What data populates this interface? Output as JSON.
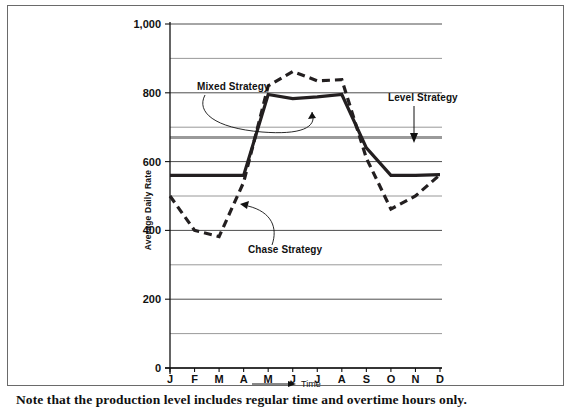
{
  "figure": {
    "caption": "Note that the production level includes regular time and overtime hours only."
  },
  "chart_data": {
    "type": "line",
    "title": "",
    "xlabel": "Time",
    "ylabel": "Average Daily Rate",
    "categories": [
      "J",
      "F",
      "M",
      "A",
      "M",
      "J",
      "J",
      "A",
      "S",
      "O",
      "N",
      "D"
    ],
    "x_tick_labels": [
      "J",
      "F",
      "M",
      "A",
      "M",
      "J",
      "J",
      "A",
      "S",
      "O",
      "N",
      "D"
    ],
    "y_tick_labels": [
      "0",
      "200",
      "400",
      "600",
      "800",
      "1,000"
    ],
    "y_tick_values": [
      0,
      200,
      400,
      600,
      800,
      1000
    ],
    "ylim": [
      0,
      1000
    ],
    "gridlines": [
      0,
      100,
      200,
      300,
      400,
      500,
      600,
      700,
      800,
      900,
      1000
    ],
    "grid": true,
    "legend": "none",
    "series": [
      {
        "name": "Mixed Strategy",
        "style": "solid",
        "color": "#231f20",
        "values": [
          560,
          560,
          560,
          560,
          795,
          783,
          788,
          795,
          640,
          560,
          560,
          562
        ]
      },
      {
        "name": "Chase Strategy",
        "style": "dashed",
        "color": "#231f20",
        "values": [
          500,
          400,
          382,
          540,
          820,
          862,
          835,
          838,
          610,
          462,
          500,
          562
        ]
      },
      {
        "name": "Level Strategy",
        "style": "solid-gray",
        "color": "#9a9a9a",
        "values": [
          670,
          670,
          670,
          670,
          670,
          670,
          670,
          670,
          670,
          670,
          670,
          670
        ]
      }
    ],
    "annotations": [
      {
        "text": "Mixed Strategy",
        "target_note": "points to solid line mid-year"
      },
      {
        "text": "Chase Strategy",
        "target_note": "points to dashed line in April"
      },
      {
        "text": "Level Strategy",
        "target_note": "points to gray horizontal line at 670"
      }
    ]
  }
}
